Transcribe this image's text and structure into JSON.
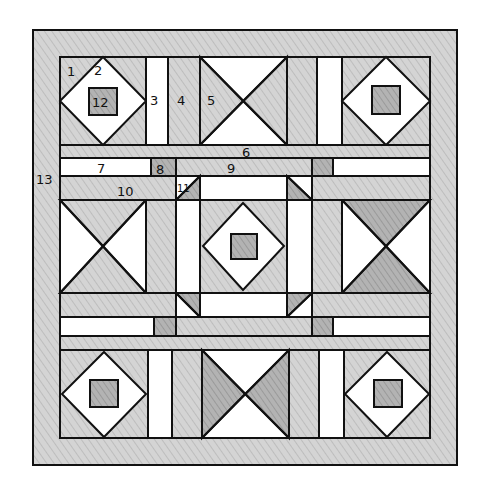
{
  "diagram": {
    "colors": {
      "background": "#ffffff",
      "outline": "#111111",
      "light_fabric": "#ffffff",
      "medium_fabric": "#cfcfcf",
      "dark_fabric": "#a8a8a8",
      "border_fabric": "#d6d6d6"
    },
    "labels": [
      {
        "id": "1",
        "text": "1",
        "x": 67,
        "y": 76
      },
      {
        "id": "2",
        "text": "2",
        "x": 94,
        "y": 75
      },
      {
        "id": "3",
        "text": "3",
        "x": 150,
        "y": 105
      },
      {
        "id": "4",
        "text": "4",
        "x": 177,
        "y": 105
      },
      {
        "id": "5",
        "text": "5",
        "x": 207,
        "y": 105
      },
      {
        "id": "6",
        "text": "6",
        "x": 242,
        "y": 157
      },
      {
        "id": "7",
        "text": "7",
        "x": 97,
        "y": 173
      },
      {
        "id": "8",
        "text": "8",
        "x": 156,
        "y": 174
      },
      {
        "id": "9",
        "text": "9",
        "x": 227,
        "y": 173
      },
      {
        "id": "10",
        "text": "10",
        "x": 117,
        "y": 196
      },
      {
        "id": "11",
        "text": "11",
        "x": 177,
        "y": 192
      },
      {
        "id": "12",
        "text": "12",
        "x": 92,
        "y": 105
      },
      {
        "id": "13",
        "text": "13",
        "x": 36,
        "y": 184
      }
    ],
    "legend": {
      "1": "Diamond block corner triangle",
      "2": "Diamond block center diamond",
      "3": "Light vertical sashing strip",
      "4": "Medium vertical sashing strip",
      "5": "Hourglass block triangle",
      "6": "Horizontal sashing band",
      "7": "Light horizontal strip",
      "8": "Dark small square",
      "9": "Medium horizontal strip",
      "10": "Medium horizontal strip",
      "11": "Corner half-square triangle",
      "12": "Center small square",
      "13": "Outer border"
    }
  }
}
